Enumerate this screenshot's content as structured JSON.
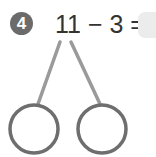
{
  "problem": {
    "number": "4",
    "equation": "11 − 3 =",
    "answer": ""
  },
  "number_bond": {
    "left_part": "",
    "right_part": ""
  },
  "colors": {
    "badge": "#6b6b6b",
    "line": "#9a9a9a",
    "circle": "#6e6e6e",
    "answer_box": "#ececec"
  }
}
